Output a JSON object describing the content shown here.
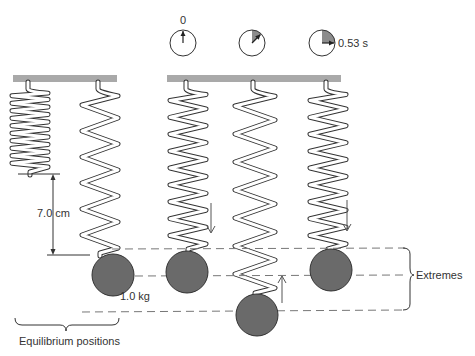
{
  "figure": {
    "type": "mass-spring oscillation diagram",
    "colors": {
      "ceiling": "#a9a9a9",
      "mass_fill": "#6a6a6a",
      "line": "#333333",
      "dash": "#777777",
      "clock_shade": "#8c8c8c"
    }
  },
  "clocks": [
    {
      "label": "0",
      "fraction_elapsed": 0
    },
    {
      "label": "",
      "fraction_elapsed": 0.125
    },
    {
      "label": "0.53 s",
      "fraction_elapsed": 0.25
    }
  ],
  "labels": {
    "displacement": "7.0 cm",
    "mass": "1.0 kg",
    "extremes": "Extremes",
    "equilibrium": "Equilibrium positions"
  },
  "arrows": [
    "down",
    "up",
    "down"
  ]
}
